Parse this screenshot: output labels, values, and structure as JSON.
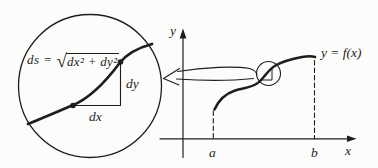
{
  "figure": {
    "ink": "#1e1e1e",
    "paper": "#fcfcfa",
    "magnifier_inset": {
      "formula_lhs": "ds =",
      "formula_radical": "√",
      "formula_radicand": "dx² + dy²",
      "dx_label": "dx",
      "dy_label": "dy"
    },
    "graph": {
      "y_axis_label": "y",
      "x_axis_label": "x",
      "curve_label": "y = f(x)",
      "interval_start_label": "a",
      "interval_end_label": "b"
    }
  }
}
